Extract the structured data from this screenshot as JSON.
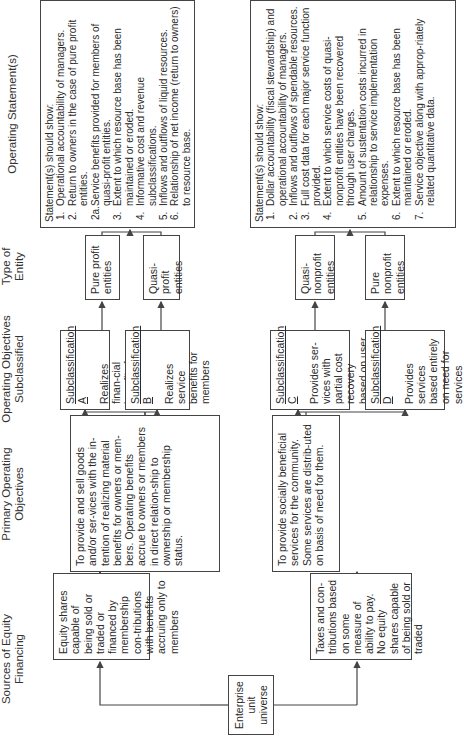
{
  "headers": {
    "sources": "Sources of Equity Financing",
    "primary": "Primary Operating Objectives",
    "subclassified": "Operating Objectives Subclassified",
    "type": "Type of Entity",
    "statements": "Operating Statement(s)"
  },
  "root": {
    "label": "Enterprise unit universe"
  },
  "sources": {
    "profit": "Equity shares capable of being sold or traded or financed by membership con-tributions with benefits accruing only to members",
    "nonprofit": "Taxes and con-tributions based on some measure of ability to pay. No equity shares capable of being sold or traded"
  },
  "primary": {
    "profit": "To provide and sell goods and/or ser-vices with the in-tention of realizing material benefits for owners or mem-bers. Operating benefits accrue to owners or members in direct relation-ship to ownership or membership status.",
    "nonprofit": "To provide socially beneficial services for the community. Some services are distrib-uted on basis of need for them."
  },
  "subclasses": [
    {
      "title": "Subclassification A",
      "text": "Realizes finan-cial benefits for owners"
    },
    {
      "title": "Subclassification B",
      "text": "Realizes service benefits for members"
    },
    {
      "title": "Subclassification C",
      "text": "Provides ser-vices with partial cost recovery based on user charges"
    },
    {
      "title": "Subclassification D",
      "text": "Provides services based entirely on need for services"
    }
  ],
  "entities": [
    {
      "label": "Pure profit entities"
    },
    {
      "label": "Quasi-profit entities"
    },
    {
      "label": "Quasi-nonprofit entities"
    },
    {
      "label": "Pure nonprofit entities"
    }
  ],
  "statements": {
    "profit": {
      "intro": "Statement(s) should show:",
      "items": [
        {
          "n": "1.",
          "text": "Operational accountability of managers."
        },
        {
          "n": "2.",
          "text": "Return to owners in the case of pure profit entities."
        },
        {
          "n": "2a.",
          "text": "Service benefits provided for members of quasi-profit entities."
        },
        {
          "n": "3.",
          "text": "Extent to which resource base has been maintained or eroded."
        },
        {
          "n": "4.",
          "text": "Informative cost and revenue subclassifications."
        },
        {
          "n": "5.",
          "text": "Inflows and outflows of liquid resources."
        },
        {
          "n": "6.",
          "text": "Relationship of net income (return to owners) to resource base."
        }
      ]
    },
    "nonprofit": {
      "intro": "Statement(s) should show:",
      "items": [
        {
          "n": "1.",
          "text": "Dollar accountability (fiscal stewardship) and operational accountability of managers."
        },
        {
          "n": "2.",
          "text": "Inflows and outflows of spendable resources."
        },
        {
          "n": "3.",
          "text": "Full cost data for each major service function provided."
        },
        {
          "n": "4.",
          "text": "Extent to which service costs of quasi-nonprofit entities have been recovered through user charges."
        },
        {
          "n": "5.",
          "text": "Amount of sustentation costs incurred in relationship to service implementation expenses."
        },
        {
          "n": "6.",
          "text": "Extent to which resource base has been maintained or eroded."
        },
        {
          "n": "7.",
          "text": "Service objective along with approp-riately related quantitative data."
        }
      ]
    }
  }
}
